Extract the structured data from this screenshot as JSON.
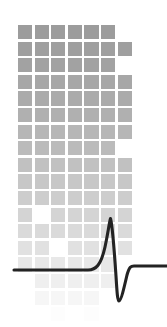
{
  "graphic": {
    "name": "ecg-pulse-logo",
    "description": "Fading mosaic of gray squares overlaid by a black ECG-style QRS spike waveform",
    "width": 167,
    "height": 327,
    "background_color": "#ffffff"
  },
  "pixel_grid": {
    "name": "fading-square-mosaic",
    "origin_x": 18,
    "origin_y": 25,
    "cell_pitch_x": 16.6,
    "cell_pitch_y": 16.6,
    "square_size": 14.2,
    "columns": 7,
    "rows": 18,
    "top_color": "#9c9c9c",
    "bottom_color": "#fdfdfd",
    "fade_gamma": 1.28,
    "occupancy": [
      [
        1,
        1,
        1,
        1,
        1,
        1,
        0
      ],
      [
        1,
        1,
        1,
        1,
        1,
        1,
        1
      ],
      [
        1,
        1,
        1,
        1,
        1,
        1,
        0
      ],
      [
        1,
        1,
        1,
        1,
        1,
        1,
        1
      ],
      [
        1,
        1,
        1,
        1,
        1,
        1,
        1
      ],
      [
        1,
        1,
        1,
        1,
        1,
        1,
        1
      ],
      [
        1,
        1,
        1,
        1,
        1,
        1,
        1
      ],
      [
        1,
        1,
        1,
        1,
        1,
        1,
        0
      ],
      [
        1,
        1,
        1,
        1,
        1,
        1,
        1
      ],
      [
        1,
        1,
        1,
        1,
        1,
        1,
        1
      ],
      [
        1,
        1,
        1,
        1,
        1,
        1,
        1
      ],
      [
        1,
        0,
        1,
        1,
        1,
        1,
        1
      ],
      [
        1,
        1,
        1,
        1,
        1,
        1,
        1
      ],
      [
        1,
        1,
        0,
        1,
        1,
        1,
        1
      ],
      [
        1,
        1,
        1,
        1,
        1,
        1,
        0
      ],
      [
        0,
        1,
        1,
        1,
        1,
        1,
        0
      ],
      [
        0,
        1,
        1,
        1,
        1,
        0,
        0
      ],
      [
        0,
        0,
        1,
        0,
        1,
        0,
        0
      ]
    ]
  },
  "waveform": {
    "name": "ecg-qrs-spike",
    "stroke_color": "#232323",
    "stroke_width": 3.1,
    "baseline_left_y": 270,
    "baseline_right_y": 266,
    "start_x": 14,
    "end_x": 167,
    "peak_x": 110,
    "peak_y": 218,
    "trough_x": 118,
    "trough_y": 301,
    "path": "M 14 270 L 88 270 C 96 270 101 265 105 247 C 108 233 109 224 110.5 218.5 C 112 224 114 246 116 276 C 117 292 117.5 301 119 301 C 121 301 124 288 127 275 C 129.5 266.5 131 266 134 266 L 167 266"
  }
}
